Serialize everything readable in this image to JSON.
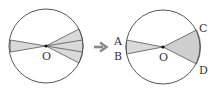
{
  "diagram": {
    "left_figure": {
      "center_label": "O",
      "shaded_sectors": 3,
      "description": "circle with center O, one thin shaded sector pointing left and three adjacent shaded sectors pointing right"
    },
    "arrow": {
      "icon": "right-arrow-icon"
    },
    "right_figure": {
      "center_label": "O",
      "point_labels": [
        "A",
        "B",
        "C",
        "D"
      ],
      "description": "circle with center O, shaded sector AOB on left and shaded sector COD on right"
    },
    "colors": {
      "stroke": "#555555",
      "fill": "#d9d9d9",
      "arrow": "#888888"
    }
  }
}
